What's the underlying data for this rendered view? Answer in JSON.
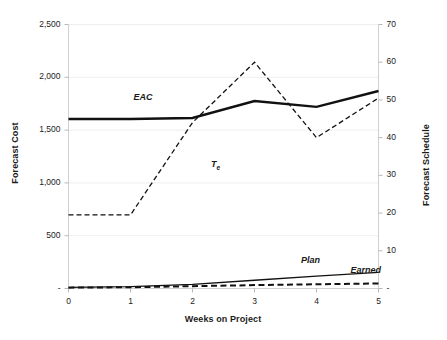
{
  "chart_data": {
    "type": "line",
    "title": "",
    "xlabel": "Weeks on Project",
    "ylabel": "Forecast Cost",
    "y2label": "Forecast Schedule",
    "x": [
      0,
      1,
      2,
      3,
      4,
      5
    ],
    "xlim": [
      0,
      5
    ],
    "ylim": [
      0,
      2500
    ],
    "y2lim": [
      0,
      70
    ],
    "grid": true,
    "legend_position": "inline-annotations",
    "xticks": [
      "0",
      "1",
      "2",
      "3",
      "4",
      "5"
    ],
    "yticks": [
      "-",
      "500",
      "1,000",
      "1,500",
      "2,000",
      "2,500"
    ],
    "ytick_values": [
      0,
      500,
      1000,
      1500,
      2000,
      2500
    ],
    "y2ticks": [
      "-",
      "10",
      "20",
      "30",
      "40",
      "50",
      "60",
      "70"
    ],
    "y2tick_values": [
      0,
      10,
      20,
      30,
      40,
      50,
      60,
      70
    ],
    "series": [
      {
        "name": "EAC",
        "axis": "left",
        "style": "solid",
        "width": 2.4,
        "color": "#111111",
        "values": [
          1605,
          1605,
          1615,
          1775,
          1720,
          1870
        ],
        "label_x": 1.05,
        "label_y": 1790
      },
      {
        "name": "Te",
        "display": "T",
        "subscript": "e",
        "axis": "right",
        "style": "dashed",
        "width": 1.3,
        "color": "#111111",
        "values": [
          19.5,
          19.5,
          44,
          60,
          40,
          50.5
        ],
        "label_x": 2.3,
        "label_y_right": 32.5
      },
      {
        "name": "Plan",
        "axis": "left",
        "style": "solid",
        "width": 1.3,
        "color": "#111111",
        "values": [
          10,
          18,
          40,
          78,
          118,
          152
        ],
        "label_x": 3.75,
        "label_y": 250
      },
      {
        "name": "Earned",
        "axis": "left",
        "style": "dashed",
        "width": 2.0,
        "color": "#111111",
        "values": [
          8,
          12,
          22,
          32,
          40,
          48
        ],
        "label_x": 4.55,
        "label_y": 160
      }
    ],
    "colors": {
      "line": "#111111",
      "grid": "#eeeeee",
      "axis": "#d0d0d0",
      "text": "#1a1a1a",
      "background": "#ffffff"
    }
  }
}
